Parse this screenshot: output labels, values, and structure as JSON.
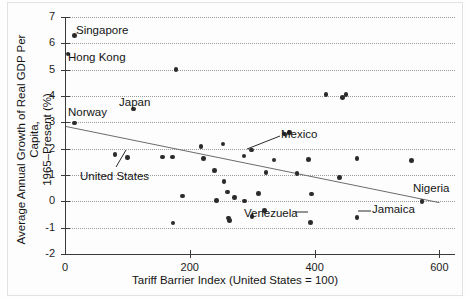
{
  "chart_data": {
    "type": "scatter",
    "title": "",
    "xlabel": "Tariff Barrier Index (United States = 100)",
    "ylabel_line1": "Average Annual Growth of Real GDP Per Capita,",
    "ylabel_line2": "1965–Present (%)",
    "xlim": [
      0,
      625
    ],
    "ylim": [
      -2,
      7
    ],
    "xticks": [
      0,
      200,
      400,
      600
    ],
    "xtick_labels": [
      "0",
      "200",
      "400",
      "600"
    ],
    "yticks": [
      -2,
      -1,
      0,
      1,
      2,
      3,
      4,
      5,
      6,
      7
    ],
    "ytick_labels": [
      "-2",
      "-1",
      "0",
      "1",
      "2",
      "3",
      "4",
      "5",
      "6",
      "7"
    ],
    "grid": "horizontal-dotted",
    "legend": "none",
    "trendline": {
      "label": "fitted regression line",
      "x_start": 0,
      "y_start": 2.85,
      "x_end": 600,
      "y_end": -0.05
    },
    "points": [
      {
        "label": "Singapore",
        "x": 15,
        "y": 6.3
      },
      {
        "label": "Hong Kong",
        "x": 5,
        "y": 5.6
      },
      {
        "label": "",
        "x": 178,
        "y": 5.0
      },
      {
        "label": "Japan",
        "x": 110,
        "y": 3.5
      },
      {
        "label": "Norway",
        "x": 15,
        "y": 2.98
      },
      {
        "label": "",
        "x": 418,
        "y": 4.05
      },
      {
        "label": "",
        "x": 450,
        "y": 4.05
      },
      {
        "label": "",
        "x": 445,
        "y": 3.95
      },
      {
        "label": "",
        "x": 360,
        "y": 2.62
      },
      {
        "label": "",
        "x": 253,
        "y": 2.18
      },
      {
        "label": "",
        "x": 218,
        "y": 2.08
      },
      {
        "label": "Mexico",
        "x": 352,
        "y": 2.55
      },
      {
        "label": "",
        "x": 299,
        "y": 1.95
      },
      {
        "label": "United States",
        "x": 100,
        "y": 1.66
      },
      {
        "label": "",
        "x": 80,
        "y": 1.78
      },
      {
        "label": "",
        "x": 156,
        "y": 1.68
      },
      {
        "label": "",
        "x": 172,
        "y": 1.69
      },
      {
        "label": "",
        "x": 222,
        "y": 1.62
      },
      {
        "label": "",
        "x": 287,
        "y": 1.72
      },
      {
        "label": "",
        "x": 335,
        "y": 1.57
      },
      {
        "label": "",
        "x": 390,
        "y": 1.58
      },
      {
        "label": "",
        "x": 468,
        "y": 1.62
      },
      {
        "label": "",
        "x": 555,
        "y": 1.55
      },
      {
        "label": "",
        "x": 240,
        "y": 1.18
      },
      {
        "label": "",
        "x": 322,
        "y": 1.1
      },
      {
        "label": "",
        "x": 372,
        "y": 1.05
      },
      {
        "label": "",
        "x": 440,
        "y": 0.9
      },
      {
        "label": "",
        "x": 255,
        "y": 0.75
      },
      {
        "label": "",
        "x": 260,
        "y": 0.35
      },
      {
        "label": "",
        "x": 188,
        "y": 0.2
      },
      {
        "label": "",
        "x": 310,
        "y": 0.3
      },
      {
        "label": "",
        "x": 395,
        "y": 0.28
      },
      {
        "label": "",
        "x": 272,
        "y": 0.15
      },
      {
        "label": "",
        "x": 288,
        "y": 0.02
      },
      {
        "label": "Nigeria",
        "x": 572,
        "y": 0.0
      },
      {
        "label": "",
        "x": 243,
        "y": 0.03
      },
      {
        "label": "",
        "x": 320,
        "y": -0.35
      },
      {
        "label": "",
        "x": 173,
        "y": -0.83
      },
      {
        "label": "",
        "x": 262,
        "y": -0.63
      },
      {
        "label": "",
        "x": 264,
        "y": -0.72
      },
      {
        "label": "",
        "x": 300,
        "y": -0.58
      },
      {
        "label": "Jamaica",
        "x": 468,
        "y": -0.62
      },
      {
        "label": "Venezuela",
        "x": 393,
        "y": -0.8
      }
    ],
    "annotations": [
      {
        "name": "Singapore",
        "text": "Singapore",
        "left": 76,
        "top": 24
      },
      {
        "name": "Hong Kong",
        "text": "Hong Kong",
        "left": 68,
        "top": 51
      },
      {
        "name": "Japan",
        "text": "Japan",
        "left": 119,
        "top": 96
      },
      {
        "name": "Norway",
        "text": "Norway",
        "left": 68,
        "top": 106
      },
      {
        "name": "Mexico",
        "text": "Mexico",
        "left": 281,
        "top": 128
      },
      {
        "name": "United States",
        "text": "United States",
        "left": 80,
        "top": 170
      },
      {
        "name": "Venezuela",
        "text": "Venezuela",
        "left": 244,
        "top": 207
      },
      {
        "name": "Jamaica",
        "text": "Jamaica",
        "left": 372,
        "top": 203
      },
      {
        "name": "Nigeria",
        "text": "Nigeria",
        "left": 413,
        "top": 182
      }
    ],
    "leader_lines": [
      {
        "name": "mexico-leader",
        "x1": 280,
        "y1": 136,
        "x2": 247,
        "y2": 149
      },
      {
        "name": "us-leader",
        "x1": 116,
        "y1": 167,
        "x2": 126,
        "y2": 150
      },
      {
        "name": "venezuela-leader",
        "x1": 295,
        "y1": 212,
        "x2": 308,
        "y2": 212
      },
      {
        "name": "jamaica-leader",
        "x1": 358,
        "y1": 211,
        "x2": 371,
        "y2": 211
      }
    ]
  }
}
